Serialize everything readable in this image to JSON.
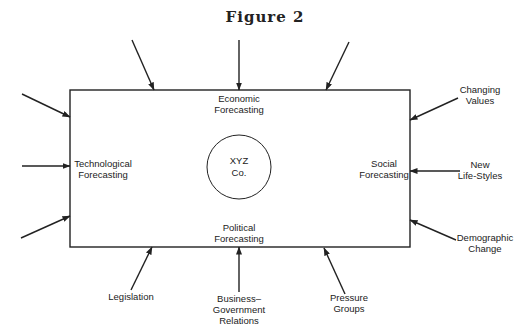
{
  "figure": {
    "title": "Figure 2",
    "box": {
      "x": 70,
      "y": 90,
      "w": 340,
      "h": 157
    },
    "center": {
      "cx": 239,
      "cy": 167,
      "r": 32,
      "lines": [
        "XYZ",
        "Co."
      ]
    },
    "inner_labels": {
      "top": [
        "Economic",
        "Forecasting"
      ],
      "left": [
        "Technological",
        "Forecasting"
      ],
      "right": [
        "Social",
        "Forecasting"
      ],
      "bottom": [
        "Political",
        "Forecasting"
      ]
    },
    "external_labels": {
      "changing_values": [
        "Changing",
        "Values"
      ],
      "new_life_styles": [
        "New",
        "Life-Styles"
      ],
      "demographic_change": [
        "Demographic",
        "Change"
      ],
      "legislation": [
        "Legislation"
      ],
      "business_government": [
        "Business–",
        "Government",
        "Relations"
      ],
      "pressure_groups": [
        "Pressure",
        "Groups"
      ]
    },
    "arrows": [
      {
        "id": "top-left",
        "x1": 132,
        "y1": 40,
        "x2": 154,
        "y2": 90
      },
      {
        "id": "top-center",
        "x1": 239,
        "y1": 40,
        "x2": 239,
        "y2": 90
      },
      {
        "id": "top-right",
        "x1": 349,
        "y1": 42,
        "x2": 326,
        "y2": 90
      },
      {
        "id": "left-top",
        "x1": 22,
        "y1": 94,
        "x2": 70,
        "y2": 117
      },
      {
        "id": "left-middle",
        "x1": 22,
        "y1": 166,
        "x2": 70,
        "y2": 166
      },
      {
        "id": "left-bottom",
        "x1": 21,
        "y1": 238,
        "x2": 70,
        "y2": 216
      },
      {
        "id": "right-changing-values",
        "x1": 458,
        "y1": 98,
        "x2": 410,
        "y2": 120
      },
      {
        "id": "right-new-life-styles",
        "x1": 460,
        "y1": 171,
        "x2": 410,
        "y2": 171
      },
      {
        "id": "right-demographic-change",
        "x1": 456,
        "y1": 240,
        "x2": 410,
        "y2": 220
      },
      {
        "id": "bottom-legislation",
        "x1": 131,
        "y1": 290,
        "x2": 152,
        "y2": 247
      },
      {
        "id": "bottom-business-government",
        "x1": 239,
        "y1": 292,
        "x2": 239,
        "y2": 247
      },
      {
        "id": "bottom-pressure-groups",
        "x1": 345,
        "y1": 294,
        "x2": 324,
        "y2": 248
      }
    ]
  }
}
